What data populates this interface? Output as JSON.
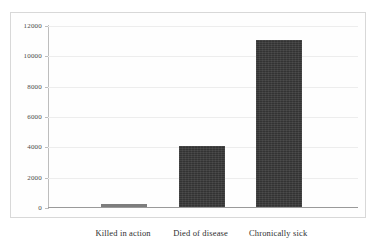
{
  "chart_data": {
    "type": "bar",
    "title": "",
    "subtitle": "",
    "xlabel": "",
    "ylabel": "",
    "categories": [
      "Killed in action",
      "Died of disease",
      "Chronically sick"
    ],
    "values": [
      100,
      4000,
      11000
    ],
    "series": [
      {
        "name": "",
        "values": [
          100,
          4000,
          11000
        ]
      }
    ],
    "ylim": [
      0,
      12000
    ],
    "yticks": [
      0,
      2000,
      4000,
      6000,
      8000,
      10000,
      12000
    ],
    "ytick_labels": [
      "0",
      "2000",
      "4000",
      "6000",
      "8000",
      "10000",
      "12000"
    ],
    "grid": true,
    "grid_axis": "y",
    "legend": false,
    "legend_position": "none",
    "annotations": [],
    "colors": {
      "bar_fill": "#3a3a3a",
      "bar_fill_small": "#7d7d7d",
      "gridline": "#ededed",
      "axis_line": "#bdbdbd",
      "baseline": "#9a9a9a",
      "frame_border": "#d8d8d8",
      "tick_label": "#4a4a4a",
      "category_label": "#2f2f2f",
      "background": "#ffffff"
    }
  }
}
